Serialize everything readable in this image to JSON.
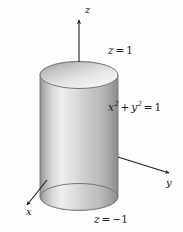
{
  "figure": {
    "kind": "3d-cylinder-diagram",
    "background_color": "#fdfdfd",
    "stroke_color": "#2b2b2b",
    "surface_light": "#f2f2f2",
    "surface_mid": "#c9c9c9",
    "surface_dark": "#9a9a9a",
    "top_cap_light": "#ececec",
    "top_cap_dark": "#a2a2a2",
    "bottom_cap_light": "#e4e4e4",
    "bottom_cap_dark": "#969696"
  },
  "axes": {
    "z": {
      "label": "z",
      "direction": "up"
    },
    "y": {
      "label": "y",
      "direction": "right"
    },
    "x": {
      "label": "x",
      "direction": "down-left"
    },
    "origin": {
      "x": 78,
      "y": 148
    }
  },
  "labels": {
    "top_plane": {
      "var": "z",
      "eq": "=",
      "value": "1"
    },
    "bottom_plane": {
      "var": "z",
      "eq": "=",
      "value": "−1"
    },
    "surface_equation": {
      "x_var": "x",
      "x_exp": "2",
      "plus": "+",
      "y_var": "y",
      "y_exp": "2",
      "eq": "=",
      "value": "1"
    }
  },
  "geometry": {
    "cylinder": {
      "center_x": 79,
      "radius_x": 39,
      "radius_y": 13.5,
      "top_center_y": 75,
      "bottom_center_y": 197
    },
    "z_axis": {
      "x": 79,
      "top_y": 18,
      "bottom_y": 148
    },
    "y_axis": {
      "end_x": 172,
      "end_y": 174
    },
    "x_axis": {
      "end_x": 24,
      "end_y": 208
    }
  }
}
